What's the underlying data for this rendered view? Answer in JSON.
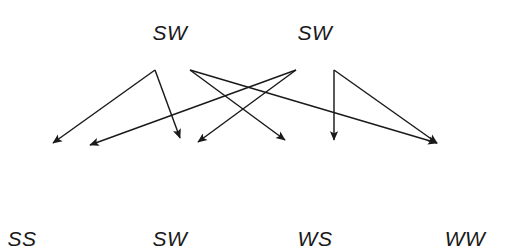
{
  "diagram": {
    "type": "pairing-transition-diagram",
    "width": 510,
    "height": 251,
    "background_color": "#ffffff",
    "stroke_color": "#1a1a1a",
    "label_color": "#1a1a1a",
    "top_labels": [
      {
        "id": "top-sw-1",
        "text": "SW",
        "x": 170,
        "y": 22
      },
      {
        "id": "top-sw-2",
        "text": "SW",
        "x": 315,
        "y": 22
      }
    ],
    "bottom_labels": [
      {
        "id": "bottom-ss",
        "text": "SS",
        "x": 22,
        "y": 228
      },
      {
        "id": "bottom-sw",
        "text": "SW",
        "x": 170,
        "y": 228
      },
      {
        "id": "bottom-ws",
        "text": "WS",
        "x": 315,
        "y": 228
      },
      {
        "id": "bottom-ww",
        "text": "WW",
        "x": 465,
        "y": 228
      }
    ],
    "source_nodes": [
      {
        "id": "v1",
        "x": 155,
        "y": 70
      },
      {
        "id": "v2",
        "x": 190,
        "y": 70
      },
      {
        "id": "v3",
        "x": 296,
        "y": 70
      },
      {
        "id": "v4",
        "x": 334,
        "y": 70
      }
    ],
    "arrowheads": [
      {
        "id": "a1",
        "x": 53,
        "y": 143
      },
      {
        "id": "a2",
        "x": 90,
        "y": 145
      },
      {
        "id": "a3",
        "x": 180,
        "y": 138
      },
      {
        "id": "a4",
        "x": 198,
        "y": 142
      },
      {
        "id": "a5",
        "x": 285,
        "y": 140
      },
      {
        "id": "a6",
        "x": 334,
        "y": 140
      },
      {
        "id": "a7",
        "x": 437,
        "y": 143
      }
    ],
    "edges": [
      {
        "id": "e1",
        "from": "v1",
        "to": "a1",
        "x1": 155,
        "y1": 70,
        "x2": 53,
        "y2": 143
      },
      {
        "id": "e2",
        "from": "v1",
        "to": "a3",
        "x1": 155,
        "y1": 70,
        "x2": 180,
        "y2": 138
      },
      {
        "id": "e3",
        "from": "v2",
        "to": "a5",
        "x1": 190,
        "y1": 70,
        "x2": 285,
        "y2": 140
      },
      {
        "id": "e4",
        "from": "v2",
        "to": "a7",
        "x1": 190,
        "y1": 70,
        "x2": 437,
        "y2": 143
      },
      {
        "id": "e5",
        "from": "v3",
        "to": "a4",
        "x1": 296,
        "y1": 70,
        "x2": 198,
        "y2": 142
      },
      {
        "id": "e6",
        "from": "v3",
        "to": "a2",
        "x1": 296,
        "y1": 70,
        "x2": 90,
        "y2": 145
      },
      {
        "id": "e7",
        "from": "v4",
        "to": "a6",
        "x1": 334,
        "y1": 70,
        "x2": 334,
        "y2": 140
      },
      {
        "id": "e8",
        "from": "v4",
        "to": "a7",
        "x1": 334,
        "y1": 70,
        "x2": 437,
        "y2": 143
      }
    ]
  }
}
